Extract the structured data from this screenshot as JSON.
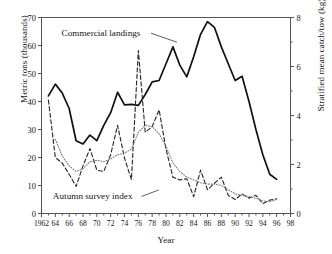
{
  "chart_data": {
    "type": "line",
    "title": "",
    "xlabel": "Year",
    "ylabel": "Metric tons (thousands)",
    "ylabel_right": "Stratified mean catch/tow (kg)",
    "xlim": [
      1962,
      1998
    ],
    "ylim": [
      0,
      70
    ],
    "ylim_right": [
      0,
      8
    ],
    "grid": false,
    "legend_position": "inline-annotations",
    "xticks": [
      1962,
      1964,
      1966,
      1968,
      1970,
      1972,
      1974,
      1976,
      1978,
      1980,
      1982,
      1984,
      1986,
      1988,
      1990,
      1992,
      1994,
      1996,
      1998
    ],
    "xtick_labels": [
      "1962",
      "64",
      "66",
      "68",
      "70",
      "72",
      "74",
      "76",
      "78",
      "80",
      "82",
      "84",
      "86",
      "88",
      "90",
      "92",
      "94",
      "96",
      "98"
    ],
    "yticks_left": [
      0,
      10,
      20,
      30,
      40,
      50,
      60,
      70
    ],
    "ytick_labels_left": [
      "0",
      "10",
      "20",
      "30",
      "40",
      "50",
      "60",
      "70"
    ],
    "yticks_right": [
      0,
      2,
      4,
      6,
      8
    ],
    "ytick_labels_right": [
      "0",
      "2",
      "4",
      "6",
      "8"
    ],
    "yticks_right_minor": [
      1,
      3,
      5,
      7
    ],
    "annotations": [
      {
        "text": "Commercial landings",
        "x": 1970.6,
        "y": 63.5
      },
      {
        "text": "Autumn survey index",
        "x": 1969.4,
        "y": 5.2
      }
    ],
    "series": [
      {
        "name": "Commercial landings",
        "style": "solid",
        "axis": "left",
        "units": "metric tons (thousands)",
        "x": [
          1963,
          1964,
          1965,
          1966,
          1967,
          1968,
          1969,
          1970,
          1971,
          1972,
          1973,
          1974,
          1975,
          1976,
          1977,
          1978,
          1979,
          1980,
          1981,
          1982,
          1983,
          1984,
          1985,
          1986,
          1987,
          1988,
          1989,
          1990,
          1991,
          1992,
          1993,
          1994,
          1995,
          1996
        ],
        "values": [
          42.0,
          46.2,
          43.0,
          37.5,
          26.0,
          24.8,
          28.0,
          26.0,
          31.5,
          36.0,
          43.3,
          38.8,
          39.0,
          38.6,
          42.5,
          47.0,
          47.5,
          53.5,
          59.5,
          53.0,
          48.8,
          56.0,
          64.0,
          68.5,
          66.5,
          59.5,
          53.5,
          47.5,
          49.0,
          40.0,
          30.0,
          21.0,
          14.0,
          12.2
        ]
      },
      {
        "name": "Autumn survey index",
        "style": "dashed",
        "axis": "right",
        "units": "kg per tow",
        "x": [
          1963,
          1964,
          1965,
          1966,
          1967,
          1968,
          1969,
          1970,
          1971,
          1972,
          1973,
          1974,
          1975,
          1976,
          1977,
          1978,
          1979,
          1980,
          1981,
          1982,
          1983,
          1984,
          1985,
          1986,
          1987,
          1988,
          1989,
          1990,
          1991,
          1992,
          1993,
          1994,
          1995,
          1996
        ],
        "values_left_scale": [
          40.5,
          20.0,
          18.0,
          14.0,
          9.7,
          17.0,
          23.2,
          15.5,
          15.0,
          21.0,
          31.5,
          19.8,
          12.1,
          58.2,
          29.0,
          31.0,
          37.0,
          23.0,
          13.0,
          12.0,
          12.4,
          6.0,
          15.5,
          8.5,
          10.8,
          13.0,
          6.5,
          5.0,
          7.0,
          5.5,
          6.5,
          3.5,
          4.8,
          5.2
        ],
        "values": [
          4.63,
          2.29,
          2.06,
          1.6,
          1.11,
          1.94,
          2.65,
          1.77,
          1.71,
          2.4,
          3.6,
          2.26,
          1.38,
          6.65,
          3.31,
          3.54,
          4.23,
          2.63,
          1.49,
          1.37,
          1.42,
          0.69,
          1.77,
          0.97,
          1.23,
          1.49,
          0.74,
          0.57,
          0.8,
          0.63,
          0.74,
          0.4,
          0.55,
          0.59
        ]
      },
      {
        "name": "Autumn survey index smoothed trend",
        "style": "dotted",
        "axis": "right",
        "units": "kg per tow",
        "x": [
          1964,
          1965,
          1966,
          1967,
          1968,
          1969,
          1970,
          1971,
          1972,
          1973,
          1974,
          1975,
          1976,
          1977,
          1978,
          1979,
          1980,
          1981,
          1982,
          1983,
          1984,
          1985,
          1986,
          1987,
          1988,
          1989,
          1990,
          1991,
          1992,
          1993,
          1994,
          1995,
          1996
        ],
        "values_left_scale": [
          26.5,
          20.5,
          17.0,
          15.0,
          16.0,
          18.5,
          19.0,
          18.5,
          19.5,
          21.0,
          21.5,
          23.0,
          29.0,
          31.5,
          31.0,
          28.5,
          24.0,
          18.0,
          15.0,
          13.0,
          12.0,
          11.0,
          10.5,
          10.5,
          10.0,
          8.5,
          7.0,
          6.5,
          6.0,
          5.5,
          4.5,
          4.2,
          5.0
        ],
        "values": [
          3.03,
          2.34,
          1.94,
          1.71,
          1.83,
          2.11,
          2.17,
          2.11,
          2.23,
          2.4,
          2.46,
          2.63,
          3.31,
          3.6,
          3.54,
          3.26,
          2.74,
          2.06,
          1.71,
          1.49,
          1.37,
          1.26,
          1.2,
          1.2,
          1.14,
          0.97,
          0.8,
          0.74,
          0.69,
          0.63,
          0.51,
          0.48,
          0.57
        ]
      }
    ]
  }
}
